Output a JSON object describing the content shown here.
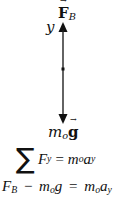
{
  "diagram": {
    "type": "free-body diagram",
    "axis_label": "y",
    "forces": [
      {
        "symbol": "F",
        "subscript": "B",
        "vector": true,
        "direction": "up"
      },
      {
        "symbol": "m",
        "subscript": "o",
        "vector_symbol": "g",
        "direction": "down"
      }
    ],
    "colors": {
      "line": "#111111",
      "background": "#ffffff"
    }
  },
  "equations": {
    "sum_symbol": "∑",
    "eq1": {
      "lhs_var": "F",
      "lhs_sub": "y",
      "equals": "=",
      "rhs_m": "m",
      "rhs_m_sub": "o",
      "rhs_a": "a",
      "rhs_a_sub": "y"
    },
    "eq2": {
      "f": "F",
      "f_sub": "B",
      "minus": "−",
      "m": "m",
      "m_sub": "o",
      "g": "g",
      "equals": "=",
      "rhs_m": "m",
      "rhs_m_sub": "o",
      "rhs_a": "a",
      "rhs_a_sub": "y"
    }
  }
}
